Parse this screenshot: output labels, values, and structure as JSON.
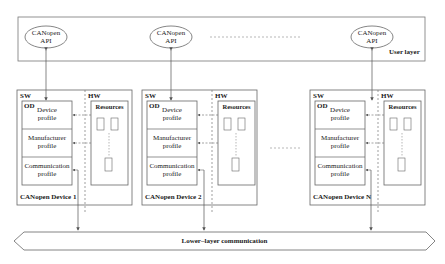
{
  "user_layer": {
    "label": "User layer",
    "apis": [
      {
        "line1": "CANopen",
        "line2": "API"
      },
      {
        "line1": "CANopen",
        "line2": "API"
      },
      {
        "line1": "CANopen",
        "line2": "API"
      }
    ]
  },
  "devices": [
    {
      "name": "CANopen Device 1",
      "sw_label": "SW",
      "hw_label": "HW",
      "od_label": "OD",
      "resources_label": "Resources",
      "profiles": [
        {
          "line1": "Device",
          "line2": "profile"
        },
        {
          "line1": "Manufacturer",
          "line2": "profile"
        },
        {
          "line1": "Communication",
          "line2": "profile"
        }
      ]
    },
    {
      "name": "CANopen Device 2",
      "sw_label": "SW",
      "hw_label": "HW",
      "od_label": "OD",
      "resources_label": "Resources",
      "profiles": [
        {
          "line1": "Device",
          "line2": "profile"
        },
        {
          "line1": "Manufacturer",
          "line2": "profile"
        },
        {
          "line1": "Communication",
          "line2": "profile"
        }
      ]
    },
    {
      "name": "CANopen Device N",
      "sw_label": "SW",
      "hw_label": "HW",
      "od_label": "OD",
      "resources_label": "Resources",
      "profiles": [
        {
          "line1": "Device",
          "line2": "profile"
        },
        {
          "line1": "Manufacturer",
          "line2": "profile"
        },
        {
          "line1": "Communication",
          "line2": "profile"
        }
      ]
    }
  ],
  "lower_layer": {
    "label": "Lower–layer communication"
  },
  "colors": {
    "line": "#555555",
    "text": "#222222",
    "background": "#ffffff"
  }
}
